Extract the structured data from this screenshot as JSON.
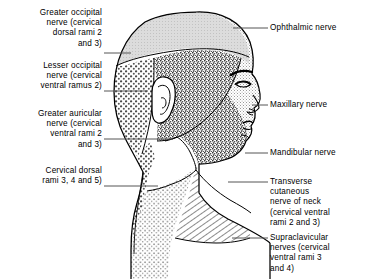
{
  "figure": {
    "background_color": "#ffffff",
    "ink_color": "#000000"
  },
  "labels_left": [
    {
      "name": "greater-occipital-nerve",
      "text": "Greater occipital\nnerve (cervical\ndorsal rami 2\nand 3)",
      "leader_from_x": 104,
      "leader_to_x": 131,
      "leader_y": 53
    },
    {
      "name": "lesser-occipital-nerve",
      "text": "Lesser occipital\nnerve (cervical\nventral ramus 2)",
      "leader_from_x": 104,
      "leader_to_x": 148,
      "leader_y": 91
    },
    {
      "name": "greater-auricular-nerve",
      "text": "Greater auricular\nnerve (cervical\nventral rami 2\nand 3)",
      "leader_from_x": 104,
      "leader_to_x": 173,
      "leader_y": 139
    },
    {
      "name": "cervical-dorsal-rami",
      "text": "Cervical dorsal\nrami 3, 4 and 5)",
      "leader_from_x": 104,
      "leader_to_x": 158,
      "leader_y": 186
    }
  ],
  "labels_right": [
    {
      "name": "ophthalmic-nerve",
      "text": "Ophthalmic nerve",
      "leader_from_x": 233,
      "leader_to_x": 268,
      "leader_y": 28
    },
    {
      "name": "maxillary-nerve",
      "text": "Maxillary nerve",
      "leader_from_x": 252,
      "leader_to_x": 268,
      "leader_y": 105
    },
    {
      "name": "mandibular-nerve",
      "text": "Mandibular nerve",
      "leader_from_x": 245,
      "leader_to_x": 268,
      "leader_y": 153
    },
    {
      "name": "transverse-cutaneous-nerve-of-neck",
      "text": "Transverse\ncutaneous\nnerve of neck\n(cervical ventral\nrami 2 and 3)",
      "leader_from_x": 228,
      "leader_to_x": 268,
      "leader_y": 182
    },
    {
      "name": "supraclavicular-nerves",
      "text": "Supraclavicular\nnerves (cervical\nventral rami 3\nand 4)",
      "leader_from_x": 232,
      "leader_to_x": 268,
      "leader_y": 238
    }
  ],
  "regions": [
    {
      "name": "greater-occipital-region",
      "texture": "light-gray-tint",
      "fill": "#d8d8d8"
    },
    {
      "name": "lesser-occipital-region",
      "texture": "coarse-open-stipple",
      "fill": "#ffffff"
    },
    {
      "name": "maxillary-region",
      "texture": "dense-dark-stipple",
      "fill": "#6e6e6e"
    },
    {
      "name": "ophthalmic-region",
      "texture": "fine-light-stipple",
      "fill": "#cfcfcf"
    },
    {
      "name": "mandibular-region",
      "texture": "dense-dark-stipple",
      "fill": "#6e6e6e"
    },
    {
      "name": "greater-auricular-region",
      "texture": "blank-white",
      "fill": "#ffffff"
    },
    {
      "name": "transverse-cutaneous-region",
      "texture": "diagonal-hatching",
      "fill": "#ffffff"
    },
    {
      "name": "supraclavicular-region",
      "texture": "medium-stipple",
      "fill": "#ffffff"
    },
    {
      "name": "cervical-dorsal-region",
      "texture": "coarse-open-stipple",
      "fill": "#ffffff"
    }
  ]
}
